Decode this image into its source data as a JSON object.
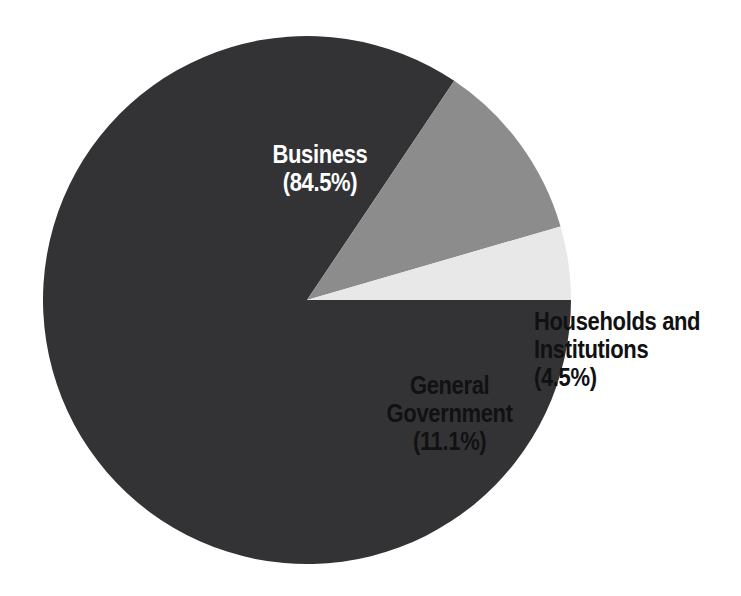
{
  "chart_data": {
    "type": "pie",
    "title": "",
    "subtitle": "",
    "xlabel": "",
    "ylabel": "",
    "legend_position": "none",
    "grid": false,
    "categories": [
      "Business",
      "General Government",
      "Households and Institutions"
    ],
    "values": [
      84.5,
      11.1,
      4.5
    ],
    "unit": "%",
    "slices": [
      {
        "name": "Business",
        "value": 84.5,
        "value_text": "(84.5%)",
        "label_line1": "Business",
        "label_line2": "(84.5%)",
        "label_full": "Business\n(84.5%)",
        "color": "#333336",
        "label_color": "#ffffff",
        "label_placement": "inside"
      },
      {
        "name": "General Government",
        "value": 11.1,
        "value_text": "(11.1%)",
        "label_line1": "General",
        "label_line2": "Government",
        "label_line3": "(11.1%)",
        "label_full": "General\nGovernment\n(11.1%)",
        "color": "#8c8c8c",
        "label_color": "#111111",
        "label_placement": "inside"
      },
      {
        "name": "Households and Institutions",
        "value": 4.5,
        "value_text": "(4.5%)",
        "label_line1": "Households and",
        "label_line2": "Institutions (4.5%)",
        "label_full": "Households and\nInstitutions (4.5%)",
        "color": "#e8e8e8",
        "label_color": "#111111",
        "label_placement": "outside-right"
      }
    ],
    "geometry": {
      "center_x": 307,
      "center_y": 300,
      "radius": 264,
      "start_angle_deg": 0,
      "direction": "clockwise"
    },
    "background_color": "#ffffff"
  }
}
